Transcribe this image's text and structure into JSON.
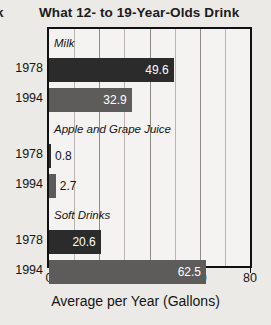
{
  "header": {
    "clipped_left_text": "k",
    "title": "What 12- to 19-Year-Olds Drink"
  },
  "axis": {
    "x_title": "Average per Year (Gallons)",
    "x_ticks": [
      "0",
      "20",
      "40",
      "60",
      "80"
    ],
    "x_tick_values": [
      0,
      20,
      40,
      60,
      80
    ],
    "x_min": 0,
    "x_max": 80,
    "minor_step": 10
  },
  "colors": {
    "bar_1978": "#2b2b2b",
    "bar_1994": "#5e5c5a",
    "plot_background": "#f5f3f1",
    "page_background": "#eceae7",
    "frame": "#111111",
    "gridline": "#b9b6b2",
    "text": "#141414"
  },
  "groups": [
    {
      "caption": "Milk",
      "rows": [
        {
          "year": "1978",
          "value": 49.6,
          "value_label": "49.6",
          "series": "1978",
          "label_position": "inside"
        },
        {
          "year": "1994",
          "value": 32.9,
          "value_label": "32.9",
          "series": "1994",
          "label_position": "inside"
        }
      ]
    },
    {
      "caption": "Apple and Grape Juice",
      "rows": [
        {
          "year": "1978",
          "value": 0.8,
          "value_label": "0.8",
          "series": "1978",
          "label_position": "outside"
        },
        {
          "year": "1994",
          "value": 2.7,
          "value_label": "2.7",
          "series": "1994",
          "label_position": "outside"
        }
      ]
    },
    {
      "caption": "Soft Drinks",
      "rows": [
        {
          "year": "1978",
          "value": 20.6,
          "value_label": "20.6",
          "series": "1978",
          "label_position": "inside"
        },
        {
          "year": "1994",
          "value": 62.5,
          "value_label": "62.5",
          "series": "1994",
          "label_position": "inside"
        }
      ]
    }
  ],
  "chart_data": {
    "type": "bar",
    "orientation": "horizontal",
    "title": "What 12- to 19-Year-Olds Drink",
    "xlabel": "Average per Year (Gallons)",
    "ylabel": "",
    "xlim": [
      0,
      80
    ],
    "xticks": [
      0,
      20,
      40,
      60,
      80
    ],
    "grid": true,
    "legend": "none",
    "categories": [
      "Milk",
      "Apple and Grape Juice",
      "Soft Drinks"
    ],
    "series": [
      {
        "name": "1978",
        "values": [
          49.6,
          0.8,
          20.6
        ],
        "color": "#2b2b2b"
      },
      {
        "name": "1994",
        "values": [
          32.9,
          2.7,
          62.5
        ],
        "color": "#5e5c5a"
      }
    ],
    "data_labels": [
      {
        "category": "Milk",
        "series": "1978",
        "value": 49.6,
        "label": "49.6"
      },
      {
        "category": "Milk",
        "series": "1994",
        "value": 32.9,
        "label": "32.9"
      },
      {
        "category": "Apple and Grape Juice",
        "series": "1978",
        "value": 0.8,
        "label": "0.8"
      },
      {
        "category": "Apple and Grape Juice",
        "series": "1994",
        "value": 2.7,
        "label": "2.7"
      },
      {
        "category": "Soft Drinks",
        "series": "1978",
        "value": 20.6,
        "label": "20.6"
      },
      {
        "category": "Soft Drinks",
        "series": "1994",
        "value": 62.5,
        "label": "62.5"
      }
    ]
  }
}
